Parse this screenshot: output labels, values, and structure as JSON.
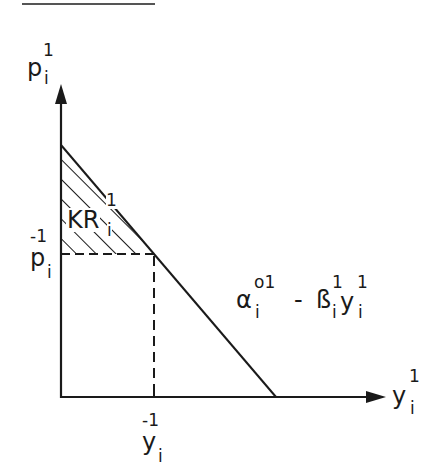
{
  "caption_fragment": {
    "note": "top caption line cropped; only underline and descenders visible",
    "underline_color": "#555555"
  },
  "diagram": {
    "type": "economics-demand-curve",
    "colors": {
      "ink": "#1a1a1a",
      "background": "#ffffff"
    },
    "y_axis": {
      "symbol": "p",
      "superscript": "1",
      "subscript": "i"
    },
    "x_axis": {
      "symbol": "y",
      "superscript": "1",
      "subscript": "i"
    },
    "price_mark": {
      "symbol": "p",
      "superscript": "-1",
      "subscript": "i"
    },
    "quantity_mark": {
      "symbol": "y",
      "superscript": "-1",
      "subscript": "i"
    },
    "shaded_region": {
      "symbol": "KR",
      "superscript": "1",
      "subscript": "i"
    },
    "demand_line": {
      "alpha": "α",
      "alpha_sup": "o1",
      "alpha_sub": "i",
      "minus": "-",
      "beta": "ß",
      "beta_sup": "1",
      "beta_sub": "i",
      "y": "y",
      "y_sup": "1",
      "y_sub": "i"
    },
    "geometry": {
      "origin": [
        60,
        397
      ],
      "y_axis_top": [
        60,
        85
      ],
      "x_axis_end": [
        385,
        397
      ],
      "demand_intercept_y": [
        60,
        145
      ],
      "demand_intercept_x": [
        276,
        397
      ],
      "equilibrium": [
        154,
        254
      ]
    }
  }
}
